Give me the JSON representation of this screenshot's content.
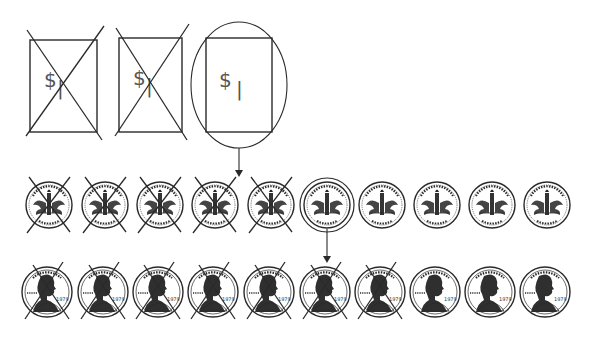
{
  "title": "Regrouping money: 1 dollar to 10 dimes to 10 pennies",
  "bills": [
    {
      "label": "$",
      "digit": "|",
      "crossed": true
    },
    {
      "label": "$",
      "digit": "|",
      "crossed": true
    },
    {
      "label": "$",
      "digit": "|",
      "crossed": false,
      "circled": true
    }
  ],
  "dimes": {
    "count": 10,
    "crossed": [
      true,
      true,
      true,
      true,
      true,
      false,
      false,
      false,
      false,
      false
    ],
    "circled_index": 5,
    "rim_text_top": "LIBERTY UNITED STATES OF AMERICA",
    "rim_text_bottom": "ONE DIME"
  },
  "pennies": {
    "count": 10,
    "crossed": [
      true,
      true,
      true,
      true,
      true,
      true,
      true,
      false,
      false,
      false
    ],
    "rim_text_top": "IN GOD WE TRUST",
    "year": "1979",
    "side_text": "LIBERTY"
  },
  "arrows": [
    {
      "from": "circled-bill",
      "to": "dime-row"
    },
    {
      "from": "circled-dime",
      "to": "penny-row"
    }
  ]
}
